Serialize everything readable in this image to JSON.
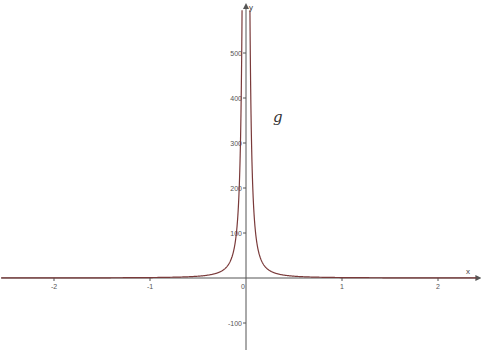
{
  "chart_data": {
    "type": "line",
    "title": "",
    "function_label": "g",
    "expression_estimate": "g(x) = 1/x^2",
    "xlabel": "x",
    "ylabel": "y",
    "xlim": [
      -2.55,
      2.4
    ],
    "ylim": [
      -160,
      590
    ],
    "x_ticks": [
      -2,
      -1,
      0,
      1,
      2
    ],
    "x_tick_labels": [
      "-2",
      "-1",
      "0",
      "1",
      "2"
    ],
    "y_ticks": [
      -100,
      100,
      200,
      300,
      400,
      500
    ],
    "y_tick_labels": [
      "-100",
      "100",
      "200",
      "300",
      "400",
      "500"
    ],
    "grid": false,
    "legend": "none",
    "series": [
      {
        "name": "g",
        "color": "#7a3a3a",
        "x": [
          -2.5,
          -2,
          -1.5,
          -1,
          -0.5,
          -0.3,
          -0.2,
          -0.15,
          -0.1,
          -0.07,
          -0.058,
          -0.05,
          -0.045,
          0.045,
          0.05,
          0.058,
          0.07,
          0.1,
          0.15,
          0.2,
          0.3,
          0.5,
          1,
          1.5,
          2,
          2.4
        ],
        "values": [
          0.16,
          0.25,
          0.44,
          1,
          4,
          11.1,
          25,
          44.4,
          100,
          204,
          297,
          400,
          494,
          494,
          400,
          297,
          204,
          100,
          44.4,
          25,
          11.1,
          4,
          1,
          0.44,
          0.25,
          0.17
        ]
      }
    ]
  },
  "layout": {
    "origin_px": [
      246,
      278
    ],
    "px_per_x_unit": 96,
    "px_per_y_unit": 0.45,
    "axis_color": "#555555",
    "curve_color": "#7a3a3a"
  }
}
